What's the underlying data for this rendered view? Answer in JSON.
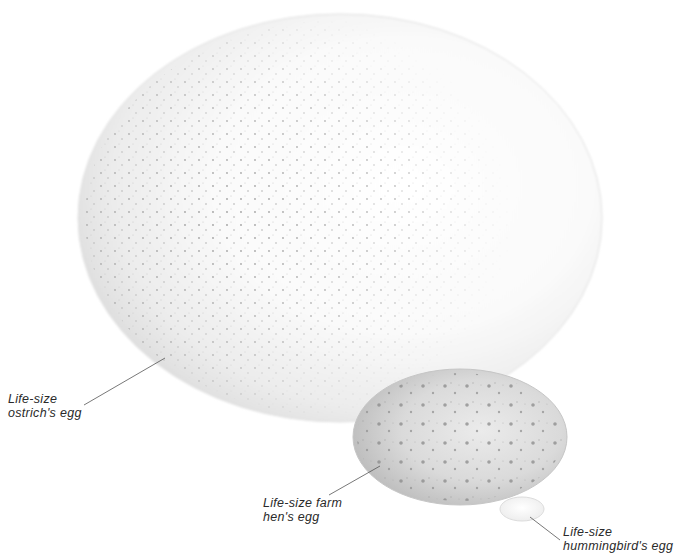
{
  "illustration": {
    "subject": "Life-size egg comparison",
    "background_color": "#ffffff",
    "eggs": [
      {
        "id": "ostrich",
        "label_lines": [
          "Life-size",
          "ostrich's egg"
        ],
        "shell_color": "#f4f4f4",
        "speckle_color": "#8a8a8a"
      },
      {
        "id": "hen",
        "label_lines": [
          "Life-size farm",
          "hen's egg"
        ],
        "shell_color": "#dcdcdc",
        "speckle_color": "#7a7a7a"
      },
      {
        "id": "hummingbird",
        "label_lines": [
          "Life-size",
          "hummingbird's egg"
        ],
        "shell_color": "#fbfbfb",
        "speckle_color": ""
      }
    ]
  }
}
